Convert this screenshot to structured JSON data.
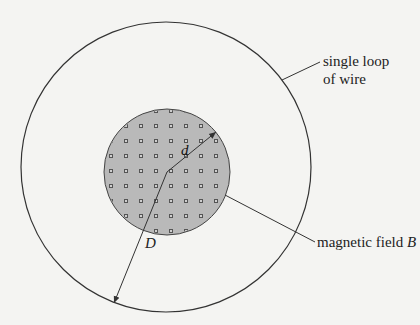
{
  "diagram": {
    "labels": {
      "loop_line1": "single loop",
      "loop_line2": "of wire",
      "field_text": "magnetic field ",
      "field_symbol": "B",
      "small_d": "d",
      "big_D": "D"
    },
    "outer_circle": {
      "cx": 166,
      "cy": 167,
      "r": 145,
      "meaning": "single loop of wire"
    },
    "inner_circle": {
      "cx": 167,
      "cy": 172,
      "r": 63,
      "fill": "#b9b9b9",
      "meaning": "magnetic field region, out of page (dots)"
    },
    "colors": {
      "stroke": "#333333",
      "background": "#f4f4f2",
      "field_fill": "#b9b9b9"
    }
  }
}
